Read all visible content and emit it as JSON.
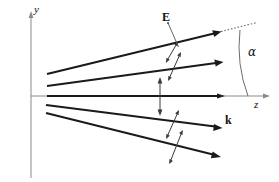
{
  "figure": {
    "kind": "vector-diagram",
    "width": 279,
    "height": 182,
    "background_color": "#ffffff",
    "labels": {
      "y_axis": "y",
      "z_axis": "z",
      "e_field": "E",
      "wave_vector": "k",
      "angle": "α"
    },
    "colors": {
      "axis": "#8a8a8a",
      "ray": "#1a1a1a",
      "efield": "#3a3a3a",
      "dotted_extension": "#6d6d6d",
      "arc": "#6d6d6d",
      "text": "#111111"
    },
    "label_positions": {
      "y_axis": {
        "x": 35,
        "y": 8
      },
      "z_axis": {
        "x": 255,
        "y": 104
      },
      "e_field": {
        "x": 163,
        "y": 14
      },
      "wave_vector": {
        "x": 226,
        "y": 119
      },
      "angle": {
        "x": 249,
        "y": 52
      }
    },
    "axes": {
      "y": {
        "x": 31,
        "y_top": 13,
        "y_bottom": 178
      },
      "z": {
        "y": 96,
        "x_left": 31,
        "x_right": 268
      }
    },
    "rays": [
      {
        "name": "ray-upper-outer",
        "x1": 47,
        "y1": 74,
        "x2": 220,
        "y2": 32
      },
      {
        "name": "ray-upper-inner",
        "x1": 47,
        "y1": 86,
        "x2": 222,
        "y2": 62
      },
      {
        "name": "ray-axial",
        "x1": 47,
        "y1": 96,
        "x2": 224,
        "y2": 96
      },
      {
        "name": "ray-lower-inner",
        "x1": 46,
        "y1": 105,
        "x2": 221,
        "y2": 128
      },
      {
        "name": "ray-lower-outer",
        "x1": 46,
        "y1": 113,
        "x2": 220,
        "y2": 157
      }
    ],
    "dotted_extension": {
      "x1": 221,
      "y1": 32,
      "x2": 256,
      "y2": 23
    },
    "efield_arrows": [
      {
        "name": "efield-upper-outer",
        "x1": 177,
        "y1": 41,
        "x2": 166,
        "y2": 63
      },
      {
        "name": "efield-upper-inner",
        "x1": 180,
        "y1": 52,
        "x2": 169,
        "y2": 81
      },
      {
        "name": "efield-axial",
        "x1": 160,
        "y1": 78,
        "x2": 160,
        "y2": 115
      },
      {
        "name": "efield-lower-inner",
        "x1": 178,
        "y1": 110,
        "x2": 167,
        "y2": 139
      },
      {
        "name": "efield-lower-outer",
        "x1": 182,
        "y1": 130,
        "x2": 170,
        "y2": 164
      }
    ],
    "angle_arc": {
      "x1": 240,
      "y1": 30,
      "cx": 237,
      "cy": 64,
      "x2": 248,
      "y2": 96
    },
    "leaders": [
      {
        "name": "leader-e-field",
        "x1": 168,
        "y1": 22,
        "x2": 179,
        "y2": 48
      }
    ]
  }
}
